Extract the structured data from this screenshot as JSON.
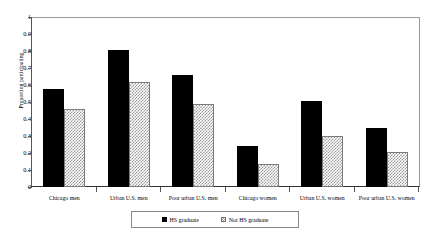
{
  "chart_data": {
    "type": "bar",
    "title": "",
    "subtitle": "",
    "xlabel": "",
    "ylabel": "Proportion participating",
    "ylim": [
      0,
      1
    ],
    "ytick_values": [
      0,
      0.1,
      0.2,
      0.3,
      0.4,
      0.5,
      0.6,
      0.7,
      0.8,
      0.9,
      1
    ],
    "ytick_labels": [
      "0",
      "0.1",
      "0.2",
      "0.3",
      "0.4",
      "0.5",
      "0.6",
      "0.7",
      "0.8",
      "0.9",
      "1"
    ],
    "grid": false,
    "legend_position": "bottom-center",
    "categories": [
      "Chicago men",
      "Urban U.S. men",
      "Poor urban U.S. men",
      "Chicago women",
      "Urban U.S. women",
      "Poor urban U.S. women"
    ],
    "series": [
      {
        "name": "HS graduate",
        "pattern": "solid-black",
        "color": "#000000",
        "values": [
          0.58,
          0.81,
          0.66,
          0.24,
          0.51,
          0.35
        ]
      },
      {
        "name": "Not HS graduate",
        "pattern": "checkered-gray",
        "color": "#9a9a9a",
        "values": [
          0.46,
          0.62,
          0.49,
          0.135,
          0.3,
          0.21
        ]
      }
    ]
  },
  "legend": {
    "entries": [
      {
        "label": "HS graduate"
      },
      {
        "label": "Not HS graduate"
      }
    ]
  }
}
